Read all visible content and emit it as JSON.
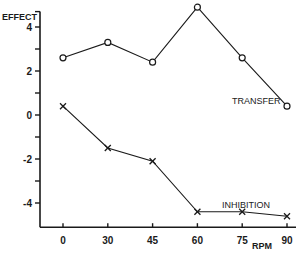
{
  "chart_data": {
    "type": "line",
    "title": "",
    "xlabel": "RPM",
    "ylabel": "EFFECT",
    "x": [
      0,
      30,
      45,
      60,
      75,
      90
    ],
    "x_tick_labels": [
      "0",
      "30",
      "45",
      "60",
      "75",
      "90"
    ],
    "y_ticks": [
      4,
      2,
      0,
      -2,
      -4
    ],
    "y_tick_labels": [
      "4",
      "2",
      "0",
      "-2",
      "-4"
    ],
    "y_minor_ticks": [
      3,
      1,
      -1,
      -3
    ],
    "ylim": [
      -5.1,
      4.7
    ],
    "grid": false,
    "series": [
      {
        "name": "TRANSFER",
        "marker": "circle",
        "values": [
          2.6,
          3.3,
          2.4,
          4.9,
          2.6,
          0.4
        ]
      },
      {
        "name": "INHIBITION",
        "marker": "x",
        "values": [
          0.4,
          -1.5,
          -2.1,
          -4.4,
          -4.4,
          -4.6
        ]
      }
    ],
    "colors": {
      "ink": "#1a1a1a",
      "background": "#ffffff"
    }
  }
}
